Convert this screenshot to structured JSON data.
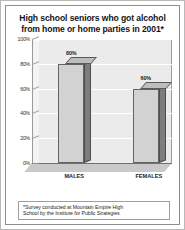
{
  "chart_data": {
    "type": "bar",
    "title": "High school seniors who got alcohol from home or home parties in 2001*",
    "title_line_1": "High school seniors who got alcohol",
    "title_line_2": "from home or home parties in 2001*",
    "categories": [
      "MALES",
      "FEMALES"
    ],
    "values": [
      80,
      60
    ],
    "value_labels": [
      "80%",
      "60%"
    ],
    "xlabel": "",
    "ylabel": "",
    "ylim": [
      0,
      100
    ],
    "y_ticks": [
      0,
      20,
      40,
      60,
      80,
      100
    ],
    "y_tick_labels": [
      "0%",
      "20%",
      "40%",
      "60%",
      "80%",
      "100%"
    ],
    "grid": true,
    "legend": "none",
    "style_3d": true,
    "footnote": "*Survey conducted at Mountain Empire High School by the Institute for Public Strategies",
    "footnote_line_1": "*Survey conducted at Mountain Empire High",
    "footnote_line_2": "School by the Institute for Public Strategies",
    "colors": {
      "bar_front": "#d2d2d2",
      "bar_side": "#7d7d7d",
      "bar_top": "#bdbdbd",
      "plot_background": "#ebebeb",
      "floor": "#c9c9c9",
      "gridline": "#ffffff",
      "text": "#1a1a1a",
      "border": "#8f8f8f"
    }
  }
}
